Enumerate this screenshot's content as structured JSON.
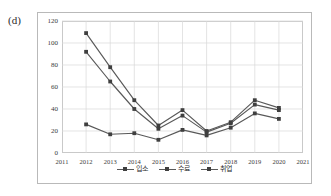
{
  "panel": {
    "label": "(d)"
  },
  "chart_data": {
    "type": "line",
    "title": "",
    "xlabel": "",
    "ylabel": "",
    "categories": [
      2011,
      2012,
      2013,
      2014,
      2015,
      2016,
      2017,
      2018,
      2019,
      2020,
      2021
    ],
    "xtick_labels": [
      "2011",
      "2012",
      "2013",
      "2014",
      "2015",
      "2016",
      "2017",
      "2018",
      "2019",
      "2020",
      "2021"
    ],
    "ytick_labels": [
      "0",
      "20",
      "40",
      "60",
      "80",
      "100",
      "120"
    ],
    "yticks": [
      0,
      20,
      40,
      60,
      80,
      100,
      120
    ],
    "ylim": [
      0,
      120
    ],
    "xlim": [
      2011,
      2021
    ],
    "grid": true,
    "legend_position": "bottom",
    "series": [
      {
        "name": "입소",
        "color": "#595959",
        "x": [
          2012,
          2013,
          2014,
          2015,
          2016,
          2017,
          2018,
          2019,
          2020
        ],
        "values": [
          109,
          78,
          48,
          25,
          39,
          20,
          28,
          48,
          41
        ]
      },
      {
        "name": "수료",
        "color": "#595959",
        "x": [
          2012,
          2013,
          2014,
          2015,
          2016,
          2017,
          2018,
          2019,
          2020
        ],
        "values": [
          92,
          65,
          40,
          22,
          34,
          19,
          27,
          44,
          39
        ]
      },
      {
        "name": "취업",
        "color": "#595959",
        "x": [
          2012,
          2013,
          2014,
          2015,
          2016,
          2017,
          2018,
          2019,
          2020
        ],
        "values": [
          26,
          17,
          18,
          12,
          21,
          16,
          23,
          36,
          31
        ]
      }
    ]
  },
  "colors": {
    "line": "#595959",
    "marker": "#3f3f3f",
    "grid": "#d9d9d9",
    "plot_border": "#c9c9c9",
    "frame_border": "#b9b9b9",
    "tick_text": "#3a3a3a"
  }
}
